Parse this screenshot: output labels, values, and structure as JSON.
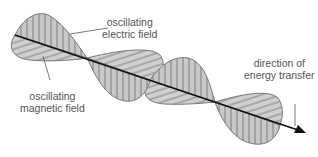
{
  "diagram": {
    "labels": {
      "electric": [
        "oscillating",
        "electric field"
      ],
      "magnetic": [
        "oscillating",
        "magnetic field"
      ],
      "direction": [
        "direction of",
        "energy transfer"
      ]
    },
    "colors": {
      "fill": "#c8c8c8",
      "outline": "#777777",
      "hatch": "#666666",
      "axis": "#111111",
      "text": "#555555"
    }
  }
}
